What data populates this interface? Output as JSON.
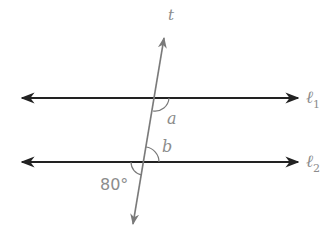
{
  "diagram": {
    "type": "parallel lines cut by a transversal",
    "transversal": {
      "label": "t"
    },
    "lines": [
      {
        "label": "ℓ",
        "subscript": "1"
      },
      {
        "label": "ℓ",
        "subscript": "2"
      }
    ],
    "angles": [
      {
        "name": "a",
        "label": "a"
      },
      {
        "name": "b",
        "label": "b"
      },
      {
        "name": "given",
        "label": "80°"
      }
    ],
    "colors": {
      "parallel_lines": "#222222",
      "transversal": "#7a7a7a",
      "labels": "#8c8c8c"
    }
  }
}
